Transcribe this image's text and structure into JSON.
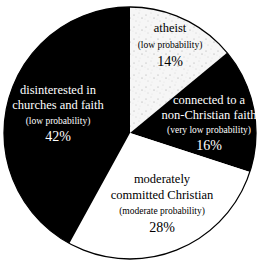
{
  "chart_data": {
    "type": "pie",
    "title": "",
    "start_angle_deg": 0,
    "direction": "clockwise",
    "legend": "none (labels placed inside slices)",
    "slices": [
      {
        "label": "atheist",
        "note": "(low probability)",
        "value": 14,
        "value_label": "14%",
        "fill": "speckled",
        "fill_color": "#f4f4f4",
        "text_color": "#000000"
      },
      {
        "label": "connected to a non-Christian faith",
        "label_lines": [
          "connected to a",
          "non-Christian faith"
        ],
        "note": "(very low probability)",
        "value": 16,
        "value_label": "16%",
        "fill": "solid",
        "fill_color": "#000000",
        "text_color": "#ffffff"
      },
      {
        "label": "moderately committed Christian",
        "label_lines": [
          "moderately",
          "committed Christian"
        ],
        "note": "(moderate probability)",
        "value": 28,
        "value_label": "28%",
        "fill": "solid",
        "fill_color": "#ffffff",
        "text_color": "#000000"
      },
      {
        "label": "disinterested in churches and faith",
        "label_lines": [
          "disinterested in",
          "churches and faith"
        ],
        "note": "(low probability)",
        "value": 42,
        "value_label": "42%",
        "fill": "solid",
        "fill_color": "#000000",
        "text_color": "#ffffff"
      }
    ],
    "categories": [
      "atheist",
      "connected to a non-Christian faith",
      "moderately committed Christian",
      "disinterested in churches and faith"
    ],
    "values": [
      14,
      16,
      28,
      42
    ]
  },
  "labels": {
    "atheist": {
      "line1": "atheist",
      "note": "(low probability)",
      "pct": "14%"
    },
    "nonchristian": {
      "line1": "connected to a",
      "line2": "non-Christian faith",
      "note": "(very low probability)",
      "pct": "16%"
    },
    "moderate": {
      "line1": "moderately",
      "line2": "committed Christian",
      "note": "(moderate probability)",
      "pct": "28%"
    },
    "disinterested": {
      "line1": "disinterested in",
      "line2": "churches and faith",
      "note": "(low probability)",
      "pct": "42%"
    }
  }
}
